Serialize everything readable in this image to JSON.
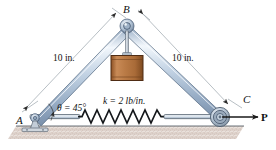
{
  "figure": {
    "type": "engineering-mechanics-diagram",
    "labels": {
      "point_a": "A",
      "point_b": "B",
      "point_c": "C",
      "length_left": "10 in.",
      "length_right": "10 in.",
      "angle": "θ = 45°",
      "spring_constant": "k = 2 lb/in.",
      "force": "P"
    },
    "values": {
      "bar_length_in": 10,
      "angle_deg": 45,
      "spring_k_lb_per_in": 2
    },
    "colors": {
      "bar_fill": "#b9c9de",
      "bar_highlight": "#eef4fa",
      "bar_edge": "#6a7f99",
      "block_fill": "#b5713c",
      "block_edge": "#5a3318",
      "ground_fill": "#ded2cc",
      "line": "#1a1a1a",
      "dim_line": "#9aa3ab"
    }
  }
}
